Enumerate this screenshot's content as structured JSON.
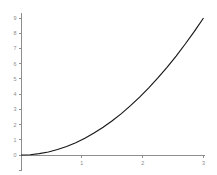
{
  "chart_data": {
    "type": "line",
    "title": "",
    "subtitle": "",
    "xlabel": "",
    "ylabel": "",
    "xlim": [
      0,
      3
    ],
    "ylim": [
      -1,
      9.3
    ],
    "grid": false,
    "legend": null,
    "background_color": "#ffffff",
    "axis_color": "#8e8e8e",
    "tick_label_color": "#8c8c8c",
    "series": [
      {
        "name": "y = x^2",
        "color": "#17171a",
        "x": [
          0,
          0.15,
          0.3,
          0.45,
          0.6,
          0.75,
          0.9,
          1.05,
          1.2,
          1.35,
          1.5,
          1.65,
          1.8,
          1.95,
          2.1,
          2.25,
          2.4,
          2.55,
          2.7,
          2.85,
          3
        ],
        "values": [
          0,
          0.02,
          0.09,
          0.2,
          0.36,
          0.56,
          0.81,
          1.1,
          1.44,
          1.82,
          2.25,
          2.72,
          3.24,
          3.8,
          4.41,
          5.06,
          5.76,
          6.5,
          7.29,
          8.12,
          9
        ]
      }
    ],
    "x_ticks": [
      {
        "value": 1,
        "label": "1"
      },
      {
        "value": 2,
        "label": "2"
      },
      {
        "value": 3,
        "label": "3"
      }
    ],
    "y_ticks": [
      {
        "value": -1,
        "label": ""
      },
      {
        "value": 0,
        "label": "0"
      },
      {
        "value": 1,
        "label": "1"
      },
      {
        "value": 2,
        "label": "2"
      },
      {
        "value": 3,
        "label": "3"
      },
      {
        "value": 4,
        "label": "4"
      },
      {
        "value": 5,
        "label": "5"
      },
      {
        "value": 6,
        "label": "6"
      },
      {
        "value": 7,
        "label": "7"
      },
      {
        "value": 8,
        "label": "8"
      },
      {
        "value": 9,
        "label": "9"
      }
    ]
  }
}
